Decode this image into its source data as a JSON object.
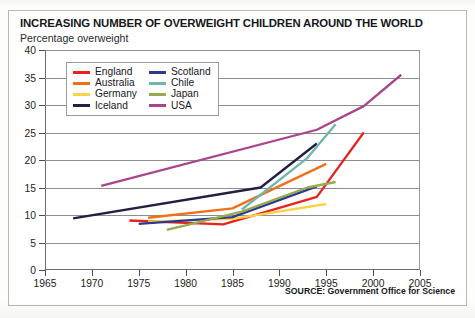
{
  "header": {
    "title": "INCREASING NUMBER OF OVERWEIGHT CHILDREN AROUND THE WORLD",
    "subtitle": "Percentage overweight"
  },
  "footer": {
    "source": "SOURCE: Government Office for Science"
  },
  "chart_data": {
    "type": "line",
    "title": "INCREASING NUMBER OF OVERWEIGHT CHILDREN AROUND THE WORLD",
    "subtitle": "Percentage overweight",
    "xlabel": "",
    "ylabel": "Percentage overweight",
    "xlim": [
      1965,
      2005
    ],
    "ylim": [
      0,
      40
    ],
    "xticks": [
      1965,
      1970,
      1975,
      1980,
      1985,
      1990,
      1995,
      2000,
      2005
    ],
    "yticks": [
      0,
      5,
      10,
      15,
      20,
      25,
      30,
      35,
      40
    ],
    "grid": "horizontal",
    "legend_position": "top-left-inside",
    "series": [
      {
        "name": "England",
        "color": "#e8231f",
        "x": [
          1974,
          1984,
          1994,
          1999
        ],
        "values": [
          9.0,
          8.3,
          13.3,
          25.0
        ]
      },
      {
        "name": "Australia",
        "color": "#f0701a",
        "x": [
          1976,
          1985,
          1995
        ],
        "values": [
          9.5,
          11.2,
          19.3
        ]
      },
      {
        "name": "Germany",
        "color": "#fbd34a",
        "x": [
          1976,
          1985,
          1995
        ],
        "values": [
          8.8,
          9.3,
          12.0
        ]
      },
      {
        "name": "Iceland",
        "color": "#231f3e",
        "x": [
          1968,
          1988,
          1994
        ],
        "values": [
          9.4,
          15.0,
          23.0
        ]
      },
      {
        "name": "Scotland",
        "color": "#2b3a8f",
        "x": [
          1975,
          1985,
          1994
        ],
        "values": [
          8.4,
          9.6,
          15.2
        ]
      },
      {
        "name": "Chile",
        "color": "#6fb6ad",
        "x": [
          1986,
          1993,
          1996
        ],
        "values": [
          11.0,
          20.4,
          26.5
        ]
      },
      {
        "name": "Japan",
        "color": "#96aa52",
        "x": [
          1978,
          1986,
          1993,
          1996
        ],
        "values": [
          7.3,
          10.6,
          15.0,
          16.0
        ]
      },
      {
        "name": "USA",
        "color": "#a8458b",
        "x": [
          1971,
          1994,
          1999,
          2003
        ],
        "values": [
          15.3,
          25.5,
          29.8,
          35.5
        ]
      }
    ]
  }
}
